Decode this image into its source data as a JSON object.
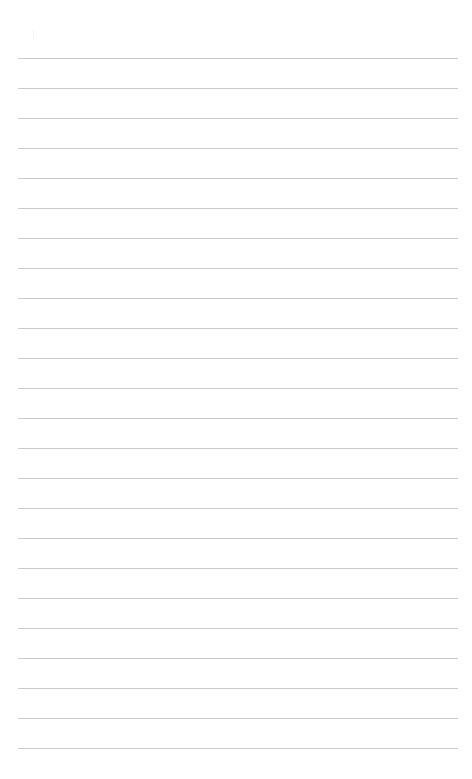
{
  "document": {
    "kind": "lined-paper-page",
    "title": "Blank ruled page",
    "background_color": "#ffffff",
    "width_px": 472,
    "height_px": 779,
    "visible_text": "",
    "body_text": ""
  },
  "ruling": {
    "line_color": "#c9c9cf",
    "line_thickness_px": 1,
    "line_left_px": 18,
    "line_right_px": 458,
    "line_length_px": 440,
    "first_line_y_px": 57.5,
    "line_spacing_px": 30,
    "line_count": 24,
    "lines_y_px": [
      57.5,
      87.5,
      117.5,
      147.5,
      177.5,
      207.5,
      237.5,
      267.5,
      297.5,
      327.5,
      357.5,
      387.5,
      417.5,
      447.5,
      477.5,
      507.5,
      537.5,
      567.5,
      597.5,
      627.5,
      657.5,
      687.5,
      717.5,
      747.5
    ]
  },
  "marks": {
    "faint_tick": {
      "name": "faint-tick-mark",
      "x_px": 33,
      "y_px": 30,
      "width_px": 1,
      "height_px": 9,
      "color": "#f2f2f4"
    }
  },
  "margins": {
    "top_margin_px": 57,
    "bottom_margin_px": 31,
    "left_margin_px": 18,
    "right_margin_px": 14
  }
}
